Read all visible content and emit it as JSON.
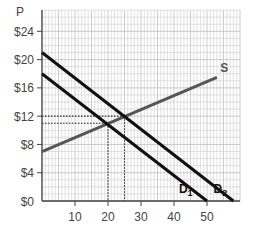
{
  "chart_data": {
    "type": "line",
    "title": "",
    "xlabel": "",
    "ylabel": "P",
    "xlim": [
      0,
      60
    ],
    "ylim": [
      0,
      27
    ],
    "grid": true,
    "x_ticks": [
      10,
      20,
      30,
      40,
      50
    ],
    "x_tick_labels": [
      "10",
      "20",
      "30",
      "40",
      "50"
    ],
    "y_ticks": [
      0,
      4,
      8,
      12,
      16,
      20,
      24
    ],
    "y_tick_labels": [
      "$0",
      "$4",
      "$8",
      "$12",
      "$16",
      "$20",
      "$24"
    ],
    "series": [
      {
        "name": "S",
        "label": "S",
        "color": "#555555",
        "points": [
          [
            0,
            7
          ],
          [
            53,
            17.5
          ]
        ]
      },
      {
        "name": "D1",
        "label": "D",
        "sub": "1",
        "color": "#111111",
        "points": [
          [
            0,
            18
          ],
          [
            50,
            0
          ]
        ]
      },
      {
        "name": "D2",
        "label": "D",
        "sub": "2",
        "color": "#111111",
        "points": [
          [
            0,
            21
          ],
          [
            58,
            0
          ]
        ]
      }
    ],
    "guides": [
      {
        "from": [
          0,
          11
        ],
        "to": [
          20,
          11
        ],
        "style": "dotted"
      },
      {
        "from": [
          20,
          11
        ],
        "to": [
          20,
          0
        ],
        "style": "dotted"
      },
      {
        "from": [
          0,
          12
        ],
        "to": [
          25,
          12
        ],
        "style": "dotted"
      },
      {
        "from": [
          25,
          12
        ],
        "to": [
          25,
          0
        ],
        "style": "dotted"
      }
    ],
    "annotations": [
      {
        "text": "S",
        "at": [
          54,
          18.5
        ]
      },
      {
        "text": "D1",
        "at": [
          45,
          1.5
        ]
      },
      {
        "text": "D2",
        "at": [
          56,
          1.5
        ]
      }
    ]
  }
}
